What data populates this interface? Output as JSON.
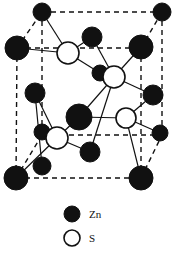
{
  "figure": {
    "name": "zinc-blende-unit-cell",
    "title": "",
    "background_color": "#ffffff",
    "line_color": "#111111",
    "atom_fill_zn": "#111111",
    "atom_fill_s": "#ffffff",
    "atom_stroke": "#111111",
    "cell_edge_style": "dashed",
    "bond_style": "solid"
  },
  "legend": {
    "entries": [
      {
        "symbol": "zn-atom-marker",
        "label": "Zn",
        "fill": "#111111",
        "radius": 8
      },
      {
        "symbol": "s-atom-marker",
        "label": "S",
        "fill": "#ffffff",
        "radius": 8
      }
    ]
  },
  "chart_data": {
    "type": "scatter",
    "xlabel": "",
    "ylabel": "",
    "grid": false,
    "legend_position": "bottom-center",
    "series": [
      {
        "name": "Zn",
        "color": "#111111",
        "points": [
          {
            "id": "zn-back-top-left",
            "x": 42,
            "y": 12,
            "r": 9
          },
          {
            "id": "zn-back-top-right",
            "x": 162,
            "y": 12,
            "r": 9
          },
          {
            "id": "zn-front-top-left",
            "x": 17,
            "y": 48,
            "r": 12
          },
          {
            "id": "zn-front-top-right",
            "x": 141,
            "y": 47,
            "r": 12
          },
          {
            "id": "zn-top-mid-interior",
            "x": 92,
            "y": 37,
            "r": 10
          },
          {
            "id": "zn-mid-left-face",
            "x": 35,
            "y": 93,
            "r": 10
          },
          {
            "id": "zn-mid-right-face",
            "x": 153,
            "y": 95,
            "r": 10
          },
          {
            "id": "zn-center-upper",
            "x": 100,
            "y": 73,
            "r": 8
          },
          {
            "id": "zn-center-large",
            "x": 79,
            "y": 117,
            "r": 13
          },
          {
            "id": "zn-left-inner-lower",
            "x": 42,
            "y": 132,
            "r": 8
          },
          {
            "id": "zn-bottom-mid",
            "x": 90,
            "y": 152,
            "r": 10
          },
          {
            "id": "zn-right-inner-lower",
            "x": 160,
            "y": 133,
            "r": 8
          },
          {
            "id": "zn-front-bottom-left",
            "x": 16,
            "y": 178,
            "r": 12
          },
          {
            "id": "zn-front-bottom-right",
            "x": 141,
            "y": 178,
            "r": 12
          },
          {
            "id": "zn-back-bottom-mid",
            "x": 42,
            "y": 166,
            "r": 9
          }
        ]
      },
      {
        "name": "S",
        "color": "#ffffff",
        "points": [
          {
            "id": "s-upper-left",
            "x": 68,
            "y": 53,
            "r": 11
          },
          {
            "id": "s-upper-right",
            "x": 114,
            "y": 77,
            "r": 11
          },
          {
            "id": "s-lower-left",
            "x": 57,
            "y": 138,
            "r": 11
          },
          {
            "id": "s-lower-right",
            "x": 126,
            "y": 118,
            "r": 10
          }
        ]
      }
    ],
    "cell_edges": [
      {
        "id": "edge-back-top",
        "x1": 42,
        "y1": 12,
        "x2": 162,
        "y2": 12
      },
      {
        "id": "edge-back-left",
        "x1": 42,
        "y1": 12,
        "x2": 42,
        "y2": 135
      },
      {
        "id": "edge-back-right",
        "x1": 162,
        "y1": 12,
        "x2": 162,
        "y2": 135
      },
      {
        "id": "edge-back-bottom",
        "x1": 42,
        "y1": 135,
        "x2": 162,
        "y2": 135
      },
      {
        "id": "edge-front-top",
        "x1": 17,
        "y1": 48,
        "x2": 141,
        "y2": 48
      },
      {
        "id": "edge-front-left",
        "x1": 17,
        "y1": 48,
        "x2": 16,
        "y2": 178
      },
      {
        "id": "edge-front-right",
        "x1": 141,
        "y1": 48,
        "x2": 141,
        "y2": 178
      },
      {
        "id": "edge-front-bottom",
        "x1": 16,
        "y1": 178,
        "x2": 141,
        "y2": 178
      },
      {
        "id": "edge-diag-top-left",
        "x1": 17,
        "y1": 48,
        "x2": 42,
        "y2": 12
      },
      {
        "id": "edge-diag-top-right",
        "x1": 141,
        "y1": 48,
        "x2": 162,
        "y2": 12
      },
      {
        "id": "edge-diag-bottom-left",
        "x1": 16,
        "y1": 178,
        "x2": 42,
        "y2": 135
      },
      {
        "id": "edge-diag-bottom-right",
        "x1": 141,
        "y1": 178,
        "x2": 162,
        "y2": 135
      }
    ],
    "bonds": [
      {
        "from": "s-upper-left",
        "to": "zn-back-top-left"
      },
      {
        "from": "s-upper-left",
        "to": "zn-top-mid-interior"
      },
      {
        "from": "s-upper-left",
        "to": "zn-front-top-left"
      },
      {
        "from": "s-upper-left",
        "to": "zn-center-upper"
      },
      {
        "from": "s-upper-right",
        "to": "zn-top-mid-interior"
      },
      {
        "from": "s-upper-right",
        "to": "zn-center-upper"
      },
      {
        "from": "s-upper-right",
        "to": "zn-front-top-right"
      },
      {
        "from": "s-upper-right",
        "to": "zn-mid-right-face"
      },
      {
        "from": "s-upper-right",
        "to": "zn-center-large"
      },
      {
        "from": "s-upper-right",
        "to": "zn-bottom-mid"
      },
      {
        "from": "s-lower-left",
        "to": "zn-left-inner-lower"
      },
      {
        "from": "s-lower-left",
        "to": "zn-center-large"
      },
      {
        "from": "s-lower-left",
        "to": "zn-bottom-mid"
      },
      {
        "from": "s-lower-left",
        "to": "zn-front-bottom-left"
      },
      {
        "from": "s-lower-left",
        "to": "zn-mid-left-face"
      },
      {
        "from": "s-lower-right",
        "to": "zn-center-large"
      },
      {
        "from": "s-lower-right",
        "to": "zn-mid-right-face"
      },
      {
        "from": "s-lower-right",
        "to": "zn-right-inner-lower"
      },
      {
        "from": "s-lower-right",
        "to": "zn-front-bottom-right"
      },
      {
        "from": "zn-mid-left-face",
        "to": "zn-back-bottom-mid"
      }
    ]
  }
}
